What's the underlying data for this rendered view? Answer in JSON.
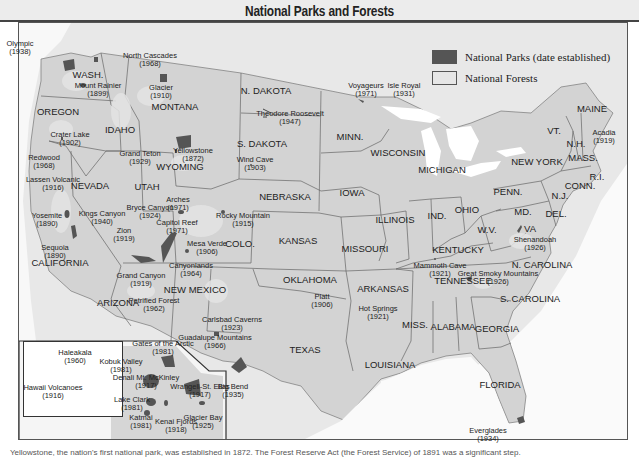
{
  "title": "National Parks and Forests",
  "colors": {
    "park": "#555555",
    "forest": "#e0e0e0",
    "land": "#d6d6d6",
    "water": "#ffffff",
    "border": "#666666"
  },
  "legend": {
    "items": [
      {
        "label": "National Parks (date established)",
        "swatch": "#555555"
      },
      {
        "label": "National Forests",
        "swatch": "#e6e6e6"
      }
    ]
  },
  "states": [
    {
      "name": "WASH.",
      "x": 88,
      "y": 75
    },
    {
      "name": "OREGON",
      "x": 58,
      "y": 112
    },
    {
      "name": "IDAHO",
      "x": 120,
      "y": 130
    },
    {
      "name": "MONTANA",
      "x": 175,
      "y": 107
    },
    {
      "name": "WYOMING",
      "x": 180,
      "y": 167
    },
    {
      "name": "N. DAKOTA",
      "x": 266,
      "y": 91
    },
    {
      "name": "S. DAKOTA",
      "x": 262,
      "y": 144
    },
    {
      "name": "NEVADA",
      "x": 90,
      "y": 186
    },
    {
      "name": "UTAH",
      "x": 147,
      "y": 187
    },
    {
      "name": "CALIFORNIA",
      "x": 60,
      "y": 263
    },
    {
      "name": "COLO.",
      "x": 240,
      "y": 244
    },
    {
      "name": "NEBRASKA",
      "x": 285,
      "y": 197
    },
    {
      "name": "KANSAS",
      "x": 298,
      "y": 241
    },
    {
      "name": "OKLAHOMA",
      "x": 310,
      "y": 280
    },
    {
      "name": "ARIZONA",
      "x": 118,
      "y": 303
    },
    {
      "name": "NEW MEXICO",
      "x": 195,
      "y": 290
    },
    {
      "name": "TEXAS",
      "x": 305,
      "y": 350
    },
    {
      "name": "MINN.",
      "x": 350,
      "y": 137
    },
    {
      "name": "IOWA",
      "x": 352,
      "y": 193
    },
    {
      "name": "MISSOURI",
      "x": 365,
      "y": 249
    },
    {
      "name": "ARKANSAS",
      "x": 383,
      "y": 289
    },
    {
      "name": "LOUISIANA",
      "x": 390,
      "y": 365
    },
    {
      "name": "WISCONSIN",
      "x": 398,
      "y": 153
    },
    {
      "name": "ILLINOIS",
      "x": 395,
      "y": 220
    },
    {
      "name": "MICHIGAN",
      "x": 442,
      "y": 170
    },
    {
      "name": "IND.",
      "x": 437,
      "y": 216
    },
    {
      "name": "OHIO",
      "x": 467,
      "y": 210
    },
    {
      "name": "KENTUCKY",
      "x": 458,
      "y": 250
    },
    {
      "name": "TENNESSEE",
      "x": 463,
      "y": 281
    },
    {
      "name": "MISS.",
      "x": 415,
      "y": 325
    },
    {
      "name": "ALABAMA",
      "x": 453,
      "y": 327
    },
    {
      "name": "GEORGIA",
      "x": 497,
      "y": 329
    },
    {
      "name": "FLORIDA",
      "x": 500,
      "y": 385
    },
    {
      "name": "S. CAROLINA",
      "x": 530,
      "y": 299
    },
    {
      "name": "N. CAROLINA",
      "x": 542,
      "y": 265
    },
    {
      "name": "VA",
      "x": 530,
      "y": 229
    },
    {
      "name": "W.V.",
      "x": 487,
      "y": 230
    },
    {
      "name": "MD.",
      "x": 523,
      "y": 212
    },
    {
      "name": "DEL.",
      "x": 556,
      "y": 214
    },
    {
      "name": "N.J.",
      "x": 560,
      "y": 196
    },
    {
      "name": "PENN.",
      "x": 508,
      "y": 192
    },
    {
      "name": "NEW YORK",
      "x": 537,
      "y": 162
    },
    {
      "name": "VT.",
      "x": 554,
      "y": 131
    },
    {
      "name": "N.H.",
      "x": 576,
      "y": 144
    },
    {
      "name": "MASS.",
      "x": 583,
      "y": 158
    },
    {
      "name": "CONN.",
      "x": 580,
      "y": 186
    },
    {
      "name": "R.I.",
      "x": 597,
      "y": 177
    },
    {
      "name": "MAINE",
      "x": 592,
      "y": 109
    }
  ],
  "parks": [
    {
      "name": "Olympic",
      "year": "1938",
      "lx": 20,
      "ly": 40,
      "px": 67,
      "py": 65
    },
    {
      "name": "North Cascades",
      "year": "1968",
      "lx": 150,
      "ly": 52,
      "px": 95,
      "py": 58
    },
    {
      "name": "Mount Rainier",
      "year": "1899",
      "lx": 98,
      "ly": 82,
      "px": 82,
      "py": 83
    },
    {
      "name": "Glacier",
      "year": "1910",
      "lx": 161,
      "ly": 84,
      "px": 162,
      "py": 77
    },
    {
      "name": "Crater Lake",
      "year": "1902",
      "lx": 70,
      "ly": 131,
      "px": 61,
      "py": 137
    },
    {
      "name": "Grand Teton",
      "year": "1929",
      "lx": 140,
      "ly": 150,
      "px": 176,
      "py": 149
    },
    {
      "name": "Yellowstone",
      "year": "1872",
      "lx": 193,
      "ly": 147,
      "px": 182,
      "py": 141
    },
    {
      "name": "Theodore Roosevelt",
      "year": "1947",
      "lx": 290,
      "ly": 110,
      "px": 266,
      "py": 111
    },
    {
      "name": "Wind Cave",
      "year": "1903",
      "lx": 255,
      "ly": 156,
      "px": 250,
      "py": 164
    },
    {
      "name": "Voyageurs",
      "year": "1971",
      "lx": 366,
      "ly": 82,
      "px": 359,
      "py": 99
    },
    {
      "name": "Isle Royal",
      "year": "1931",
      "lx": 404,
      "ly": 82,
      "px": 395,
      "py": 102
    },
    {
      "name": "Acadia",
      "year": "1919",
      "lx": 604,
      "ly": 129,
      "px": 0,
      "py": 0
    },
    {
      "name": "Redwood",
      "year": "1968",
      "lx": 44,
      "ly": 154,
      "px": 31,
      "py": 156
    },
    {
      "name": "Lassen Volcanic",
      "year": "1916",
      "lx": 53,
      "ly": 176,
      "px": 51,
      "py": 172
    },
    {
      "name": "Yosemite",
      "year": "1890",
      "lx": 47,
      "ly": 212,
      "px": 67,
      "py": 215
    },
    {
      "name": "Kings Canyon",
      "year": "1940",
      "lx": 102,
      "ly": 210,
      "px": 70,
      "py": 229
    },
    {
      "name": "Sequoia",
      "year": "1890",
      "lx": 55,
      "ly": 244,
      "px": 72,
      "py": 237
    },
    {
      "name": "Bryce Canyon",
      "year": "1924",
      "lx": 150,
      "ly": 204,
      "px": 146,
      "py": 235
    },
    {
      "name": "Zion",
      "year": "1919",
      "lx": 124,
      "ly": 227,
      "px": 141,
      "py": 236
    },
    {
      "name": "Arches",
      "year": "1971",
      "lx": 178,
      "ly": 196,
      "px": 180,
      "py": 211
    },
    {
      "name": "Capitol Reef",
      "year": "1971",
      "lx": 177,
      "ly": 219,
      "px": 168,
      "py": 233
    },
    {
      "name": "Rocky Mountain",
      "year": "1915",
      "lx": 243,
      "ly": 212,
      "px": 222,
      "py": 211
    },
    {
      "name": "Mesa Verde",
      "year": "1906",
      "lx": 207,
      "ly": 240,
      "px": 186,
      "py": 250
    },
    {
      "name": "Canyonlands",
      "year": "1964",
      "lx": 191,
      "ly": 262,
      "px": 0,
      "py": 0
    },
    {
      "name": "Grand Canyon",
      "year": "1919",
      "lx": 141,
      "ly": 272,
      "px": 135,
      "py": 255
    },
    {
      "name": "Petrified Forest",
      "year": "1962",
      "lx": 154,
      "ly": 297,
      "px": 0,
      "py": 0
    },
    {
      "name": "Platt",
      "year": "1906",
      "lx": 322,
      "ly": 293,
      "px": 313,
      "py": 302
    },
    {
      "name": "Hot Springs",
      "year": "1921",
      "lx": 378,
      "ly": 305,
      "px": 0,
      "py": 0
    },
    {
      "name": "Mammoth Cave",
      "year": "1921",
      "lx": 440,
      "ly": 262,
      "px": 434,
      "py": 258
    },
    {
      "name": "Great Smoky Mountains",
      "year": "1926",
      "lx": 498,
      "ly": 270,
      "px": 468,
      "py": 278
    },
    {
      "name": "Shenandoah",
      "year": "1926",
      "lx": 535,
      "ly": 236,
      "px": 518,
      "py": 229
    },
    {
      "name": "Carlsbad Caverns",
      "year": "1923",
      "lx": 232,
      "ly": 316,
      "px": 214,
      "py": 333
    },
    {
      "name": "Guadalupe Mountains",
      "year": "1966",
      "lx": 215,
      "ly": 334,
      "px": 0,
      "py": 0
    },
    {
      "name": "Big Bend",
      "year": "1935",
      "lx": 233,
      "ly": 383,
      "px": 238,
      "py": 369
    },
    {
      "name": "Everglades",
      "year": "1934",
      "lx": 488,
      "ly": 427,
      "px": 519,
      "py": 419
    }
  ],
  "alaska_parks": [
    {
      "name": "Gates of the Arctic",
      "year": "1981",
      "lx": 163,
      "ly": 340
    },
    {
      "name": "Kobuk Valley",
      "year": "1981",
      "lx": 121,
      "ly": 358
    },
    {
      "name": "Denali Mt. McKinley",
      "year": "1917",
      "lx": 146,
      "ly": 374
    },
    {
      "name": "Lake Clark",
      "year": "1981",
      "lx": 132,
      "ly": 396
    },
    {
      "name": "Katmai",
      "year": "1981",
      "lx": 141,
      "ly": 414
    },
    {
      "name": "Kenai Fjords",
      "year": "1918",
      "lx": 176,
      "ly": 418
    },
    {
      "name": "Wrangell-St. Elias",
      "year": "1917",
      "lx": 200,
      "ly": 383
    },
    {
      "name": "Glacier Bay",
      "year": "1925",
      "lx": 203,
      "ly": 414
    }
  ],
  "hawaii_parks": [
    {
      "name": "Haleakala",
      "year": "1960",
      "lx": 75,
      "ly": 349
    },
    {
      "name": "Hawaii Volcanoes",
      "year": "1916",
      "lx": 53,
      "ly": 384
    }
  ],
  "caption": "Yellowstone, the nation's first national park, was established in 1872. The Forest Reserve Act (the Forest Service) of 1891 was a significant step."
}
